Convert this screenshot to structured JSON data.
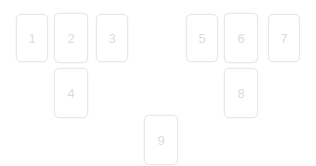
{
  "board": {
    "name": "card-board",
    "background_color": "#ffffff",
    "width": 316,
    "height": 166,
    "card": {
      "width": 32,
      "height": 48,
      "border_color": "#e8e8e8",
      "fill_color": "#ffffff",
      "corner_radius": 5,
      "label_color": "#dcdcdc"
    },
    "cards": [
      {
        "label": "1",
        "name": "card-1",
        "x": 16,
        "y": 14,
        "w": 32,
        "h": 48
      },
      {
        "label": "2",
        "name": "card-2",
        "x": 54,
        "y": 13,
        "w": 34,
        "h": 50
      },
      {
        "label": "3",
        "name": "card-3",
        "x": 96,
        "y": 14,
        "w": 32,
        "h": 48
      },
      {
        "label": "4",
        "name": "card-4",
        "x": 54,
        "y": 68,
        "w": 34,
        "h": 50
      },
      {
        "label": "5",
        "name": "card-5",
        "x": 186,
        "y": 14,
        "w": 32,
        "h": 48
      },
      {
        "label": "6",
        "name": "card-6",
        "x": 224,
        "y": 13,
        "w": 34,
        "h": 50
      },
      {
        "label": "7",
        "name": "card-7",
        "x": 268,
        "y": 14,
        "w": 32,
        "h": 48
      },
      {
        "label": "8",
        "name": "card-8",
        "x": 224,
        "y": 68,
        "w": 34,
        "h": 50
      },
      {
        "label": "9",
        "name": "card-9",
        "x": 144,
        "y": 115,
        "w": 34,
        "h": 50
      }
    ]
  }
}
